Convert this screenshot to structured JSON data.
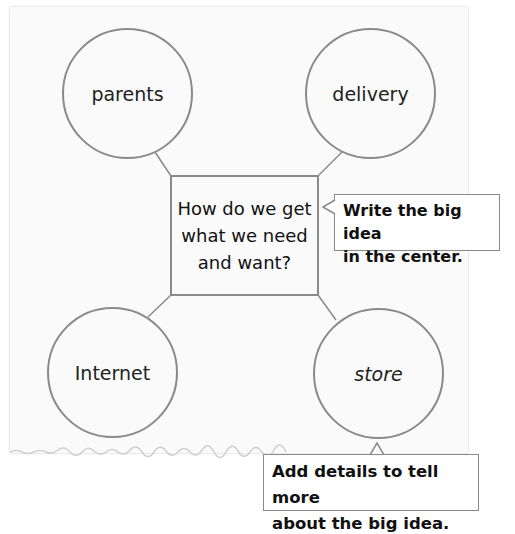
{
  "diagram": {
    "type": "web",
    "center": {
      "lines": [
        "How do we get",
        "what we need",
        "and want?"
      ]
    },
    "nodes": [
      {
        "id": "parents",
        "label": "parents"
      },
      {
        "id": "delivery",
        "label": "delivery"
      },
      {
        "id": "internet",
        "label": "Internet"
      },
      {
        "id": "store",
        "label": "store"
      }
    ],
    "callouts": {
      "big_idea": {
        "lines": [
          "Write the big idea",
          "in the center."
        ]
      },
      "details": {
        "lines": [
          "Add details to tell more",
          "about the big idea."
        ]
      }
    }
  },
  "colors": {
    "paper": "#fafafa",
    "stroke": "#8a8a8a",
    "text": "#111111"
  }
}
